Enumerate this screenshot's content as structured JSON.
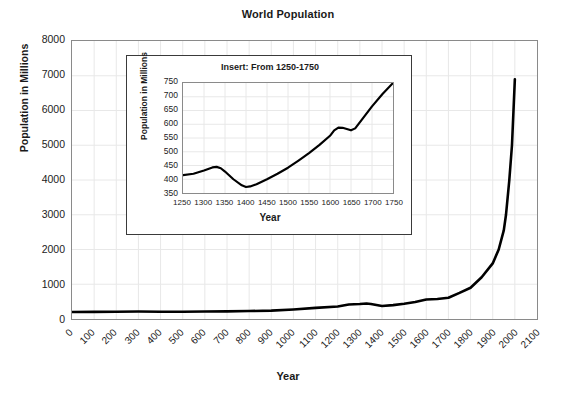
{
  "chart_data": {
    "type": "line",
    "title": "World Population",
    "xlabel": "Year",
    "ylabel": "Population in Millions",
    "xlim": [
      0,
      2100
    ],
    "ylim": [
      0,
      8000
    ],
    "grid": true,
    "legend": "none",
    "xticks": [
      "0",
      "100",
      "200",
      "300",
      "400",
      "500",
      "600",
      "700",
      "800",
      "900",
      "1000",
      "1100",
      "1200",
      "1300",
      "1400",
      "1500",
      "1600",
      "1700",
      "1800",
      "1900",
      "2000",
      "2100"
    ],
    "yticks": [
      "0",
      "1000",
      "2000",
      "3000",
      "4000",
      "5000",
      "6000",
      "7000",
      "8000"
    ],
    "x": [
      0,
      100,
      200,
      300,
      400,
      500,
      600,
      700,
      800,
      900,
      1000,
      1100,
      1200,
      1250,
      1300,
      1330,
      1350,
      1400,
      1450,
      1500,
      1550,
      1600,
      1650,
      1700,
      1750,
      1800,
      1850,
      1900,
      1927,
      1950,
      1960,
      1975,
      1987,
      2000
    ],
    "values": [
      200,
      205,
      210,
      215,
      210,
      210,
      215,
      220,
      230,
      240,
      275,
      320,
      360,
      415,
      430,
      445,
      430,
      372,
      400,
      440,
      490,
      560,
      578,
      610,
      750,
      900,
      1200,
      1600,
      2000,
      2550,
      3000,
      4000,
      5000,
      6900
    ],
    "inset": {
      "type": "line",
      "title": "Insert: From 1250-1750",
      "xlabel": "Year",
      "ylabel": "Population in Millions",
      "xlim": [
        1250,
        1750
      ],
      "ylim": [
        350,
        750
      ],
      "grid": true,
      "xticks": [
        "1250",
        "1300",
        "1350",
        "1400",
        "1450",
        "1500",
        "1550",
        "1600",
        "1650",
        "1700",
        "1750"
      ],
      "yticks": [
        "350",
        "400",
        "450",
        "500",
        "550",
        "600",
        "650",
        "700",
        "750"
      ],
      "x": [
        1250,
        1275,
        1300,
        1320,
        1330,
        1340,
        1350,
        1370,
        1390,
        1400,
        1410,
        1425,
        1450,
        1475,
        1500,
        1525,
        1550,
        1575,
        1600,
        1610,
        1620,
        1630,
        1640,
        1650,
        1660,
        1675,
        1700,
        1725,
        1750
      ],
      "values": [
        415,
        420,
        432,
        443,
        445,
        440,
        428,
        400,
        378,
        372,
        374,
        382,
        400,
        420,
        442,
        468,
        495,
        525,
        558,
        578,
        588,
        587,
        583,
        578,
        585,
        615,
        665,
        710,
        750
      ]
    }
  },
  "style": {
    "line_color": "#000000",
    "grid_color": "#e8e8e8",
    "axis_color": "#8a8a8a",
    "text_color": "#1a1a1a",
    "background": "#ffffff"
  }
}
